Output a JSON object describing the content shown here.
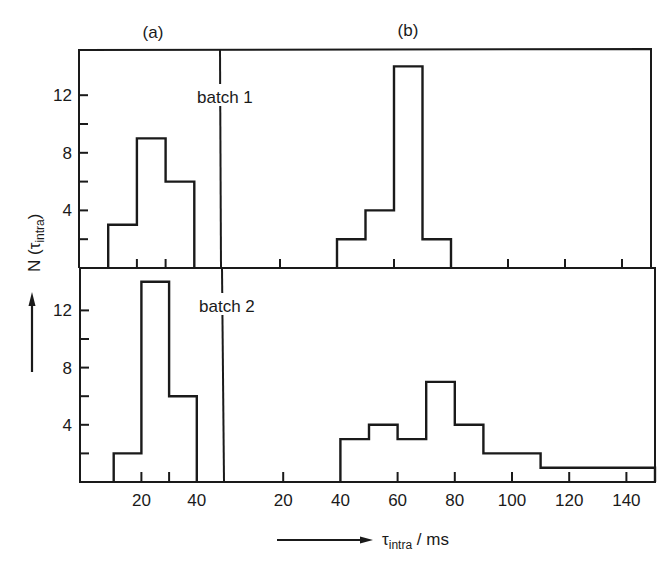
{
  "figure": {
    "panel_labels": [
      "(a)",
      "(b)"
    ],
    "batch_labels": [
      "batch 1",
      "batch 2"
    ],
    "y_axis_label": "N (τ",
    "y_axis_label_sub": "intra",
    "y_axis_label_close": ")",
    "x_axis_label": "τ",
    "x_axis_label_sub": "intra",
    "x_axis_label_unit": " / ms",
    "colors": {
      "ink": "#1a1a1a",
      "background": "#ffffff"
    }
  },
  "chart_data": [
    {
      "type": "bar",
      "title": "(a) batch 1",
      "panel": "a",
      "batch": "batch 1",
      "xlabel": "τintra / ms",
      "ylabel": "N (τintra)",
      "bins": [
        [
          10,
          20
        ],
        [
          20,
          30
        ],
        [
          30,
          40
        ]
      ],
      "values": [
        3,
        9,
        6
      ],
      "yticks": [
        4,
        8,
        12
      ],
      "ylim": [
        0,
        15
      ],
      "grid": false
    },
    {
      "type": "bar",
      "title": "(b) batch 1",
      "panel": "b",
      "batch": "batch 1",
      "xlabel": "τintra / ms",
      "ylabel": "N (τintra)",
      "bins": [
        [
          40,
          50
        ],
        [
          50,
          60
        ],
        [
          60,
          70
        ],
        [
          70,
          80
        ]
      ],
      "values": [
        2,
        4,
        14,
        2
      ],
      "xlim": [
        0,
        150
      ],
      "ylim": [
        0,
        15
      ],
      "grid": false
    },
    {
      "type": "bar",
      "title": "(a) batch 2",
      "panel": "a",
      "batch": "batch 2",
      "xlabel": "τintra / ms",
      "ylabel": "N (τintra)",
      "bins": [
        [
          10,
          20
        ],
        [
          20,
          30
        ],
        [
          30,
          40
        ]
      ],
      "values": [
        2,
        14,
        6
      ],
      "xticks": [
        20,
        40
      ],
      "yticks": [
        4,
        8,
        12
      ],
      "ylim": [
        0,
        15
      ],
      "grid": false
    },
    {
      "type": "bar",
      "title": "(b) batch 2",
      "panel": "b",
      "batch": "batch 2",
      "xlabel": "τintra / ms",
      "ylabel": "N (τintra)",
      "bins": [
        [
          40,
          50
        ],
        [
          50,
          60
        ],
        [
          60,
          70
        ],
        [
          70,
          80
        ],
        [
          80,
          90
        ],
        [
          90,
          110
        ],
        [
          110,
          150
        ]
      ],
      "values": [
        3,
        4,
        3,
        7,
        4,
        2,
        1
      ],
      "xticks": [
        20,
        40,
        60,
        80,
        100,
        120,
        140
      ],
      "xlim": [
        0,
        150
      ],
      "ylim": [
        0,
        15
      ],
      "grid": false
    }
  ],
  "axes": {
    "y_tick_labels": [
      "4",
      "8",
      "12"
    ],
    "x_tick_labels_a": [
      "20",
      "40"
    ],
    "x_tick_labels_b": [
      "20",
      "40",
      "60",
      "80",
      "100",
      "120",
      "140"
    ]
  }
}
